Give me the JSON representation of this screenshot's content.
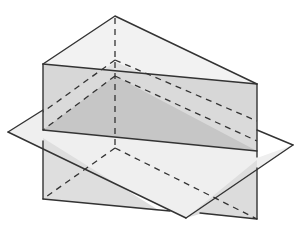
{
  "diagram": {
    "title": "Triangular prism intersected by a plane",
    "colors": {
      "background": "#ffffff",
      "edge": "#333333",
      "top_face": "#f2f2f2",
      "front_face_upper": "#d9d9d9",
      "front_face_lower": "#dcdcdc",
      "cross_section": "#c4c4c4",
      "plane": "#ededed",
      "plane_lower_left": "#e6e6e6"
    },
    "prism": {
      "top_apex": [
        115,
        16
      ],
      "top_left": [
        43,
        64
      ],
      "top_right": [
        257,
        84
      ],
      "bottom_left": [
        43,
        199
      ],
      "bottom_right": [
        257,
        219
      ],
      "back_bottom": [
        115,
        148
      ]
    },
    "plane": {
      "left": [
        8,
        132
      ],
      "right": [
        293,
        145
      ],
      "bottom": [
        186,
        218
      ],
      "top_hidden": [
        118,
        58
      ]
    },
    "cross_section": {
      "left": [
        43,
        130
      ],
      "right": [
        257,
        151
      ],
      "back": [
        115,
        76
      ]
    },
    "upper_hidden_triangle": {
      "left": [
        43,
        119
      ],
      "right": [
        257,
        139
      ],
      "back": [
        115,
        60
      ]
    }
  }
}
